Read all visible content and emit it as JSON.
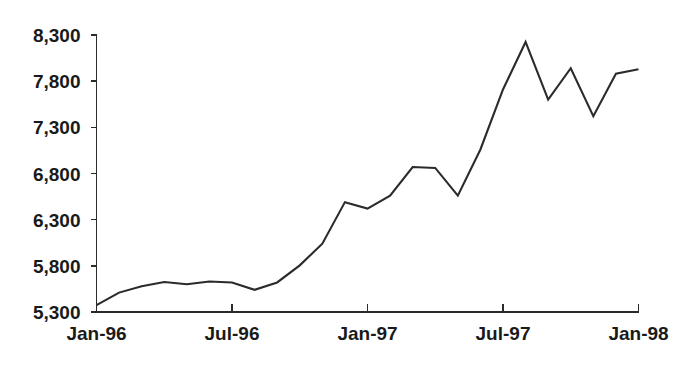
{
  "chart_data": {
    "type": "line",
    "title": "",
    "subtitle": "",
    "xlabel": "",
    "ylabel": "",
    "grid": false,
    "legend": false,
    "legend_position": "none",
    "ylim": [
      5300,
      8300
    ],
    "ytick_values": [
      5300,
      5800,
      6300,
      6800,
      7300,
      7800,
      8300
    ],
    "ytick_labels": [
      "5,300",
      "5,800",
      "6,300",
      "6,800",
      "7,300",
      "7,800",
      "8,300"
    ],
    "xtick_labels": [
      "Jan-96",
      "Jul-96",
      "Jan-97",
      "Jul-97",
      "Jan-98"
    ],
    "xtick_positions": [
      0,
      6,
      12,
      18,
      24
    ],
    "x": [
      "Jan-96",
      "Feb-96",
      "Mar-96",
      "Apr-96",
      "May-96",
      "Jun-96",
      "Jul-96",
      "Aug-96",
      "Sep-96",
      "Oct-96",
      "Nov-96",
      "Dec-96",
      "Jan-97",
      "Feb-97",
      "Mar-97",
      "Apr-97",
      "May-97",
      "Jun-97",
      "Jul-97",
      "Aug-97",
      "Sep-97",
      "Oct-97",
      "Nov-97",
      "Dec-97",
      "Jan-98"
    ],
    "series": [
      {
        "name": "Index level",
        "color": "#2b2b2b",
        "values": [
          5375,
          5510,
          5580,
          5625,
          5600,
          5630,
          5620,
          5540,
          5620,
          5805,
          6040,
          6490,
          6420,
          6560,
          6870,
          6860,
          6560,
          7060,
          7710,
          8225,
          7600,
          7940,
          7420,
          7880,
          7930
        ]
      }
    ],
    "annotations": []
  },
  "axes": {
    "y_axis_name": "value-axis",
    "x_axis_name": "time-axis"
  }
}
